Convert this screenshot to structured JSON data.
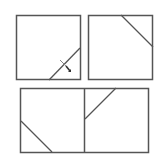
{
  "diagram": {
    "stroke_color": "#555555",
    "background": "#ffffff",
    "panels": [
      {
        "id": "square-top-left",
        "rect": {
          "x": 16.5,
          "y": 15.5,
          "w": 64,
          "h": 64
        },
        "lines": [
          {
            "x1": 49,
            "y1": 80,
            "x2": 80,
            "y2": 48
          }
        ],
        "marker": {
          "type": "scissors-cut",
          "x": 64,
          "y": 64
        }
      },
      {
        "id": "square-top-right",
        "rect": {
          "x": 88.5,
          "y": 15.5,
          "w": 64,
          "h": 64
        },
        "lines": [
          {
            "x1": 121,
            "y1": 15,
            "x2": 153,
            "y2": 47
          }
        ]
      },
      {
        "id": "rect-bottom",
        "rect": {
          "x": 20.5,
          "y": 88.5,
          "w": 128,
          "h": 64
        },
        "divider": {
          "x1": 84.5,
          "y1": 88,
          "x2": 84.5,
          "y2": 152
        },
        "lines": [
          {
            "x1": 21,
            "y1": 121,
            "x2": 52,
            "y2": 152
          },
          {
            "x1": 85,
            "y1": 119,
            "x2": 116,
            "y2": 88
          }
        ]
      }
    ]
  }
}
